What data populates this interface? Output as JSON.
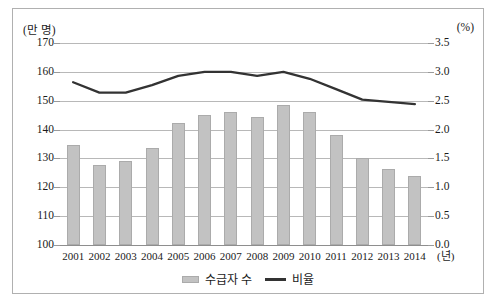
{
  "figure": {
    "left_axis_unit": "(만 명)",
    "right_axis_unit": "(%)",
    "x_axis_unit": "(년)"
  },
  "legend": {
    "items": [
      {
        "label": "수급자 수",
        "marker": "bar-swatch",
        "color": "#c2c2c2"
      },
      {
        "label": "비율",
        "marker": "line-swatch",
        "color": "#333333"
      }
    ]
  },
  "axes": {
    "left_ticks": [
      "170",
      "160",
      "150",
      "140",
      "130",
      "120",
      "110",
      "100"
    ],
    "right_ticks": [
      "3.5",
      "3.0",
      "2.5",
      "2.0",
      "1.5",
      "1.0",
      "0.5",
      "0.0"
    ],
    "left_min": 100,
    "left_max": 170,
    "right_min": 0.0,
    "right_max": 3.5
  },
  "chart_data": {
    "type": "bar",
    "title": "",
    "subtitle": "",
    "xlabel": "(년)",
    "ylabel": "(만 명)",
    "y2label": "(%)",
    "ylim": [
      100,
      170
    ],
    "y2lim": [
      0.0,
      3.5
    ],
    "grid": true,
    "legend_position": "bottom-center",
    "categories": [
      "2001",
      "2002",
      "2003",
      "2004",
      "2005",
      "2006",
      "2007",
      "2008",
      "2009",
      "2010",
      "2011",
      "2012",
      "2013",
      "2014"
    ],
    "series": [
      {
        "name": "수급자 수",
        "type": "bar",
        "axis": "left",
        "unit": "만 명",
        "color": "#c2c2c2",
        "values": [
          134.5,
          127.9,
          129.0,
          133.7,
          142.4,
          145.0,
          146.0,
          144.2,
          148.6,
          146.0,
          138.0,
          130.2,
          126.5,
          124.0
        ]
      },
      {
        "name": "비율",
        "type": "line",
        "axis": "right",
        "unit": "%",
        "color": "#333333",
        "values": [
          2.82,
          2.64,
          2.64,
          2.77,
          2.93,
          3.0,
          3.0,
          2.93,
          3.0,
          2.88,
          2.7,
          2.52,
          2.48,
          2.44
        ]
      }
    ]
  }
}
